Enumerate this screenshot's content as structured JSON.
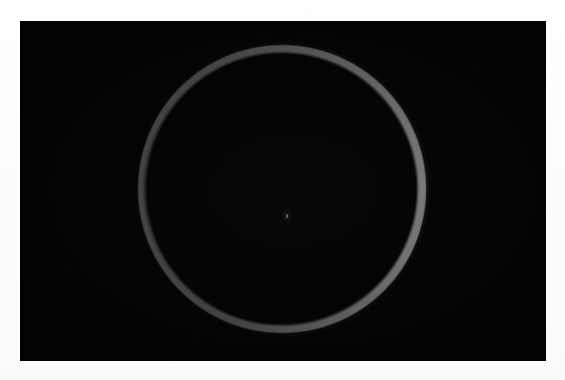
{
  "image": {
    "title": "Ring of light on black field",
    "medium": "photograph",
    "caption": "",
    "canvas": {
      "width": 565,
      "height": 380,
      "background_color": "#fdfdfd"
    },
    "photo_frame": {
      "name": "black-photographic-field",
      "left": 20,
      "top": 21,
      "width": 526,
      "height": 340,
      "background_color": "#050505",
      "border_color": "#000000"
    }
  },
  "subject": {
    "name": "luminous-ring",
    "shape": "annulus",
    "center": {
      "x": 282,
      "y": 189
    },
    "outer_radius": 145,
    "inner_radius": 137,
    "colors": {
      "brightest": "#636363",
      "mid": "#4e4e4e",
      "dimmest": "#313131",
      "halo": "#505050"
    },
    "brightness_note": "Brightest and thickest along the right and lower-right limb; thinnest and faintest along the left limb.",
    "thickness_px": {
      "right_limb": 9,
      "top": 6,
      "bottom": 6,
      "left_limb": 3
    }
  },
  "center_marker": {
    "name": "center-speck",
    "x": 287,
    "y": 216,
    "color": "#c8c8c8",
    "description": "tiny faint bright speck near the geometric center of the ring"
  }
}
